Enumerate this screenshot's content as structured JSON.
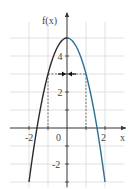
{
  "diagram": {
    "function_label": "f(x)",
    "x_axis_label": "x",
    "function": "f(x) = 5 - 2x^2",
    "x_range": [
      -2.9,
      2.9
    ],
    "y_range": [
      -3.3,
      5.9
    ],
    "x_tick_labels": [
      {
        "value": -2,
        "text": "-2"
      },
      {
        "value": 0,
        "text": "0"
      },
      {
        "value": 2,
        "text": "2"
      }
    ],
    "y_tick_labels": [
      {
        "value": 4,
        "text": "4"
      },
      {
        "value": 2,
        "text": "2"
      },
      {
        "value": -2,
        "text": "-2"
      }
    ],
    "grid_step": 1,
    "level": 3,
    "level_points_x": [
      -1,
      1
    ],
    "curve_domain": [
      -2,
      2
    ],
    "colors": {
      "left_branch": "#2b2b2b",
      "right_branch": "#2a6f97",
      "grid": "#d9d9d9",
      "axis": "#333333",
      "dashed": "#555555"
    }
  }
}
